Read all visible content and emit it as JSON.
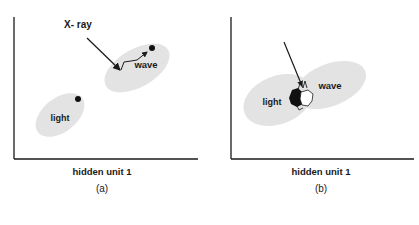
{
  "figure": {
    "panels": [
      {
        "id": "a",
        "caption": "(a)",
        "xlabel": "hidden unit 1",
        "clusters": [
          {
            "label": "light"
          },
          {
            "label": "wave"
          }
        ],
        "arrow_label": "X- ray"
      },
      {
        "id": "b",
        "caption": "(b)",
        "xlabel": "hidden unit 1",
        "clusters": [
          {
            "label": "light"
          },
          {
            "label": "wave"
          }
        ]
      }
    ],
    "colors": {
      "cluster_fill": "#e3e3e3",
      "axis": "#1a1a1a",
      "text": "#1a1a1a"
    }
  }
}
